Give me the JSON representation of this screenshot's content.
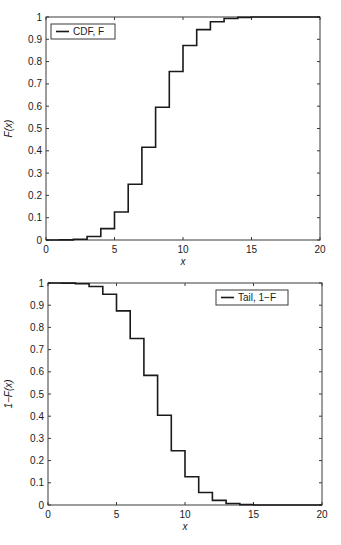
{
  "chart_data": [
    {
      "type": "line",
      "step": true,
      "title": "",
      "xlabel": "x",
      "ylabel": "F(x)",
      "xlim": [
        0,
        20
      ],
      "ylim": [
        0,
        1
      ],
      "xticks": [
        0,
        5,
        10,
        15,
        20
      ],
      "yticks": [
        0,
        0.1,
        0.2,
        0.3,
        0.4,
        0.5,
        0.6,
        0.7,
        0.8,
        0.9,
        1
      ],
      "ytick_labels": [
        "0",
        "0.1",
        "0.2",
        "0.3",
        "0.4",
        "0.5",
        "0.6",
        "0.7",
        "0.8",
        "0.9",
        "1"
      ],
      "xtick_labels": [
        "0",
        "5",
        "10",
        "15",
        "20"
      ],
      "grid": false,
      "legend_position": "upper left",
      "series": [
        {
          "name": "CDF, F",
          "x": [
            0,
            1,
            2,
            3,
            4,
            5,
            6,
            7,
            8,
            9,
            10,
            11,
            12,
            13,
            14,
            15,
            16,
            17,
            18,
            19,
            20
          ],
          "values": [
            0.0,
            0.0005,
            0.0036,
            0.016,
            0.051,
            0.1256,
            0.25,
            0.4159,
            0.5956,
            0.7553,
            0.8725,
            0.9435,
            0.979,
            0.9935,
            0.9984,
            0.9997,
            1.0,
            1.0,
            1.0,
            1.0,
            1.0
          ]
        }
      ]
    },
    {
      "type": "line",
      "step": true,
      "title": "",
      "xlabel": "x",
      "ylabel": "1−F(x)",
      "xlim": [
        0,
        20
      ],
      "ylim": [
        0,
        1
      ],
      "xticks": [
        0,
        5,
        10,
        15,
        20
      ],
      "yticks": [
        0,
        0.1,
        0.2,
        0.3,
        0.4,
        0.5,
        0.6,
        0.7,
        0.8,
        0.9,
        1
      ],
      "ytick_labels": [
        "0",
        "0.1",
        "0.2",
        "0.3",
        "0.4",
        "0.5",
        "0.6",
        "0.7",
        "0.8",
        "0.9",
        "1"
      ],
      "xtick_labels": [
        "0",
        "5",
        "10",
        "15",
        "20"
      ],
      "grid": false,
      "legend_position": "upper right",
      "series": [
        {
          "name": "Tail, 1−F",
          "x": [
            0,
            1,
            2,
            3,
            4,
            5,
            6,
            7,
            8,
            9,
            10,
            11,
            12,
            13,
            14,
            15,
            16,
            17,
            18,
            19,
            20
          ],
          "values": [
            1.0,
            0.9995,
            0.9964,
            0.984,
            0.949,
            0.8744,
            0.75,
            0.5841,
            0.4044,
            0.2447,
            0.1275,
            0.0565,
            0.021,
            0.0065,
            0.0016,
            0.0003,
            0.0,
            0.0,
            0.0,
            0.0,
            0.0
          ]
        }
      ]
    }
  ],
  "colors": {
    "line": "#1a1a1a",
    "axes": "#3a3a3a",
    "background": "#ffffff"
  }
}
